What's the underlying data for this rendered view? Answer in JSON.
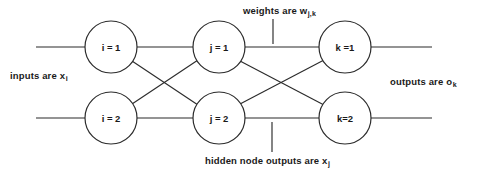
{
  "diagram": {
    "type": "neural-network",
    "layers": [
      {
        "name": "input-layer",
        "nodes": [
          {
            "id": "i1",
            "label": "i = 1",
            "cx": 111,
            "cy": 47
          },
          {
            "id": "i2",
            "label": "i = 2",
            "cx": 111,
            "cy": 118
          }
        ]
      },
      {
        "name": "hidden-layer",
        "nodes": [
          {
            "id": "j1",
            "label": "j = 1",
            "cx": 219,
            "cy": 47
          },
          {
            "id": "j2",
            "label": "j = 2",
            "cx": 219,
            "cy": 118
          }
        ]
      },
      {
        "name": "output-layer",
        "nodes": [
          {
            "id": "k1",
            "label": "k =1",
            "cx": 345,
            "cy": 47
          },
          {
            "id": "k2",
            "label": "k=2",
            "cx": 345,
            "cy": 118
          }
        ]
      }
    ],
    "node_radius": 26,
    "edges": [
      {
        "from": "i1",
        "to": "j1"
      },
      {
        "from": "i1",
        "to": "j2"
      },
      {
        "from": "i2",
        "to": "j1"
      },
      {
        "from": "i2",
        "to": "j2"
      },
      {
        "from": "j1",
        "to": "k1"
      },
      {
        "from": "j1",
        "to": "k2"
      },
      {
        "from": "j2",
        "to": "k1"
      },
      {
        "from": "j2",
        "to": "k2"
      }
    ],
    "stubs": [
      {
        "name": "input-stub-1",
        "x1": 36,
        "y1": 47,
        "x2": 85,
        "y2": 47
      },
      {
        "name": "input-stub-2",
        "x1": 36,
        "y1": 118,
        "x2": 85,
        "y2": 118
      },
      {
        "name": "output-stub-1",
        "x1": 371,
        "y1": 47,
        "x2": 432,
        "y2": 47
      },
      {
        "name": "output-stub-2",
        "x1": 371,
        "y1": 118,
        "x2": 432,
        "y2": 118
      }
    ],
    "leaders": [
      {
        "name": "weights-leader",
        "x1": 273,
        "y1": 19,
        "x2": 273,
        "y2": 44
      },
      {
        "name": "hidden-node-leader",
        "x1": 272,
        "y1": 122,
        "x2": 272,
        "y2": 152
      }
    ]
  },
  "annotations": {
    "weights": {
      "text": "weights are w",
      "subscript": "j,k"
    },
    "inputs": {
      "text": "inputs are x",
      "subscript": "i"
    },
    "outputs": {
      "text": "outputs  are o",
      "subscript": "k"
    },
    "hidden": {
      "text": "hidden node outputs are x",
      "subscript": "j"
    }
  },
  "colors": {
    "stroke": "#2b2b2b",
    "text": "#1a1a1a",
    "background": "#ffffff"
  }
}
